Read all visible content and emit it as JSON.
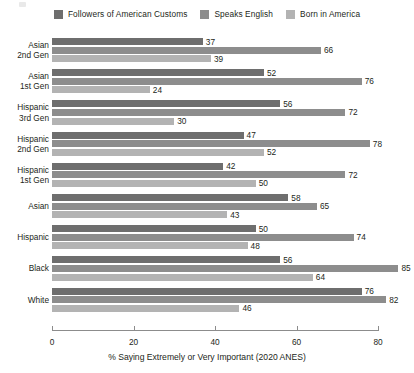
{
  "chart_data": {
    "type": "bar",
    "orientation": "horizontal",
    "title": "",
    "xlabel": "% Saying Extremely or Very Important (2020 ANES)",
    "ylabel": "",
    "xlim": [
      0,
      80
    ],
    "xticks": [
      0,
      20,
      40,
      60,
      80
    ],
    "grid": false,
    "legend_position": "top-center",
    "categories": [
      "Asian 2nd Gen",
      "Asian 1st Gen",
      "Hispanic 3rd Gen",
      "Hispanic 2nd Gen",
      "Hispanic 1st Gen",
      "Asian",
      "Hispanic",
      "Black",
      "White"
    ],
    "series": [
      {
        "name": "Followers of American Customs",
        "color": "#6e6e6e",
        "values": [
          37,
          52,
          56,
          47,
          42,
          58,
          50,
          56,
          76
        ]
      },
      {
        "name": "Speaks English",
        "color": "#8d8d8d",
        "values": [
          66,
          76,
          72,
          78,
          72,
          65,
          74,
          85,
          82
        ]
      },
      {
        "name": "Born in America",
        "color": "#b3b3b3",
        "values": [
          39,
          24,
          30,
          52,
          50,
          43,
          48,
          64,
          46
        ]
      }
    ]
  },
  "groups": [
    {
      "line1": "Asian",
      "line2": "2nd Gen"
    },
    {
      "line1": "Asian",
      "line2": "1st Gen"
    },
    {
      "line1": "Hispanic",
      "line2": "3rd Gen"
    },
    {
      "line1": "Hispanic",
      "line2": "2nd Gen"
    },
    {
      "line1": "Hispanic",
      "line2": "1st Gen"
    },
    {
      "line1": "Asian",
      "line2": ""
    },
    {
      "line1": "Hispanic",
      "line2": ""
    },
    {
      "line1": "Black",
      "line2": ""
    },
    {
      "line1": "White",
      "line2": ""
    }
  ],
  "axis": {
    "tick_labels": [
      "0",
      "20",
      "40",
      "60",
      "80"
    ],
    "title": "% Saying Extremely or Very Important (2020 ANES)"
  },
  "colors": {
    "series_dark": "#6e6e6e",
    "series_mid": "#8d8d8d",
    "series_light": "#b3b3b3",
    "axis_line": "#8c8c8c",
    "text": "#231f20",
    "background": "#ffffff"
  }
}
